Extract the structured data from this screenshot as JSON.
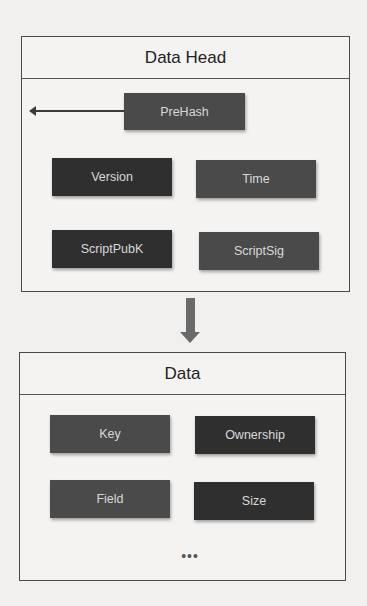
{
  "diagram": {
    "data_head": {
      "title": "Data Head",
      "prehash": "PreHash",
      "fields": [
        "Version",
        "Time",
        "ScriptPubK",
        "ScriptSig"
      ]
    },
    "data": {
      "title": "Data",
      "fields": [
        "Key",
        "Ownership",
        "Field",
        "Size"
      ],
      "ellipsis": "•••"
    },
    "arrows": [
      {
        "from": "PreHash",
        "to": "previous-block",
        "direction": "left"
      },
      {
        "from": "Data Head",
        "to": "Data",
        "direction": "down"
      }
    ],
    "colors": {
      "dark_box": "#2f2f2f",
      "mid_box": "#4a4a4a",
      "box_text": "#d8d8d8",
      "border": "#4a4a4a"
    }
  }
}
